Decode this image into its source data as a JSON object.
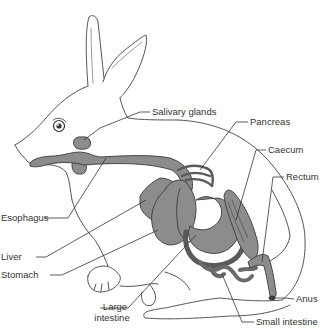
{
  "diagram": {
    "colors": {
      "background": "#ffffff",
      "outline": "#555555",
      "organ_fill": "#8c8c8c",
      "organ_stroke": "#3a3a3a",
      "leader_line": "#333333",
      "label_text": "#333333"
    },
    "labels": {
      "salivary_glands": "Salivary glands",
      "pancreas": "Pancreas",
      "caecum": "Caecum",
      "rectum": "Rectum",
      "esophagus": "Esophagus",
      "liver": "Liver",
      "stomach": "Stomach",
      "large_intestine_1": "Large",
      "large_intestine_2": "intestine",
      "anus": "Anus",
      "small_intestine": "Small intestine"
    }
  }
}
